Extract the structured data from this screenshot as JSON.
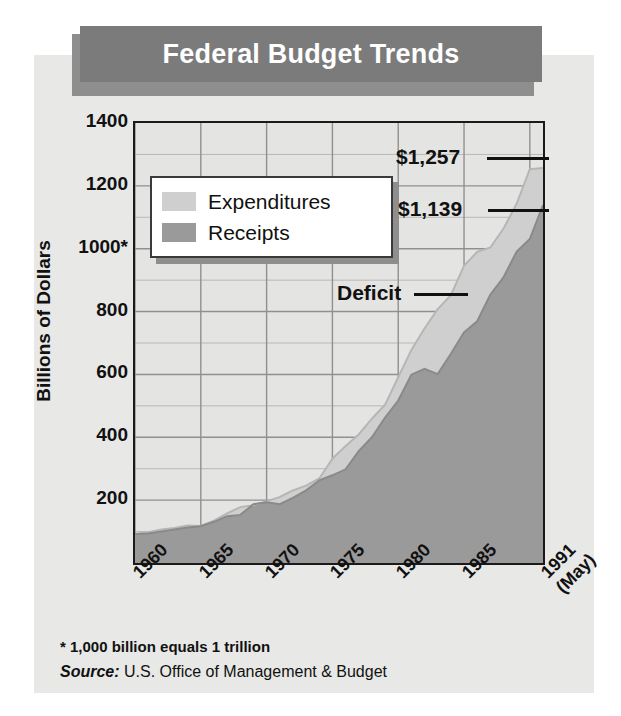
{
  "header": {
    "title": "Federal Budget Trends"
  },
  "legend": {
    "items": [
      {
        "label": "Expenditures",
        "color": "#cfcfcf"
      },
      {
        "label": "Receipts",
        "color": "#9a9a9a"
      }
    ]
  },
  "annotations": [
    {
      "name": "expenditures-value",
      "text": "$1,257"
    },
    {
      "name": "receipts-value",
      "text": "$1,139"
    },
    {
      "name": "deficit-label",
      "text": "Deficit"
    }
  ],
  "footnotes": {
    "asterisk": "* 1,000 billion equals 1 trillion",
    "source_label": "Source:",
    "source_text": "U.S. Office of Management & Budget"
  },
  "chart_data": {
    "type": "area",
    "title": "Federal Budget Trends",
    "xlabel": "",
    "ylabel": "Billions of Dollars",
    "xlim": [
      1960,
      1991
    ],
    "ylim": [
      0,
      1400
    ],
    "ytick_labels": [
      "1400",
      "1200",
      "1000*",
      "800",
      "600",
      "400",
      "200"
    ],
    "ytick_values": [
      1400,
      1200,
      1000,
      800,
      600,
      400,
      200
    ],
    "xtick_labels": [
      "1960",
      "1965",
      "1970",
      "1975",
      "1980",
      "1985",
      "1991"
    ],
    "xtick_sub_labels": [
      "",
      "",
      "",
      "",
      "",
      "",
      "(May)"
    ],
    "xtick_values": [
      1960,
      1965,
      1970,
      1975,
      1980,
      1985,
      1991
    ],
    "grid": true,
    "minor_grid_step": 100,
    "legend_position": "upper-left-inside",
    "x": [
      1960,
      1961,
      1962,
      1963,
      1964,
      1965,
      1966,
      1967,
      1968,
      1969,
      1970,
      1971,
      1972,
      1973,
      1974,
      1975,
      1976,
      1977,
      1978,
      1979,
      1980,
      1981,
      1982,
      1983,
      1984,
      1985,
      1986,
      1987,
      1988,
      1989,
      1990,
      1991
    ],
    "series": [
      {
        "name": "Expenditures",
        "color": "#cfcfcf",
        "values": [
          92,
          98,
          107,
          111,
          119,
          118,
          135,
          158,
          178,
          184,
          196,
          210,
          231,
          246,
          269,
          332,
          372,
          409,
          459,
          504,
          591,
          678,
          746,
          808,
          852,
          946,
          990,
          1004,
          1064,
          1144,
          1253,
          1257
        ]
      },
      {
        "name": "Receipts",
        "color": "#9a9a9a",
        "values": [
          92,
          94,
          100,
          107,
          113,
          117,
          131,
          149,
          153,
          187,
          193,
          187,
          207,
          231,
          263,
          279,
          298,
          356,
          400,
          463,
          517,
          599,
          618,
          601,
          666,
          734,
          769,
          854,
          909,
          991,
          1031,
          1139
        ]
      }
    ],
    "final_values": {
      "expenditures": 1257,
      "receipts": 1139
    },
    "band_between_label": "Deficit"
  }
}
